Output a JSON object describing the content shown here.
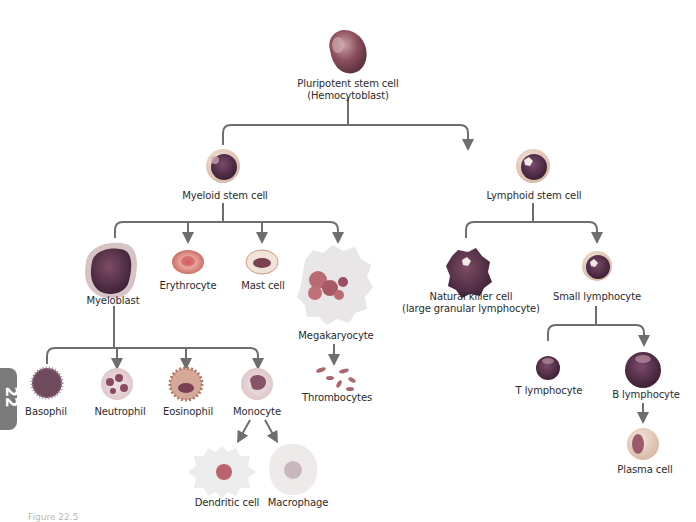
{
  "diagram": {
    "side_tab": "22",
    "caption": "Figure 22.5",
    "connector_color": "#6e6e6e",
    "nodes": {
      "hemocytoblast": {
        "line1": "Pluripotent stem cell",
        "line2": "(Hemocytoblast)"
      },
      "myeloid_stem": {
        "label": "Myeloid stem cell"
      },
      "lymphoid_stem": {
        "label": "Lymphoid stem cell"
      },
      "myeloblast": {
        "label": "Myeloblast"
      },
      "erythrocyte": {
        "label": "Erythrocyte"
      },
      "mast_cell": {
        "label": "Mast cell"
      },
      "megakaryocyte": {
        "label": "Megakaryocyte"
      },
      "thrombocytes": {
        "label": "Thrombocytes"
      },
      "basophil": {
        "label": "Basophil"
      },
      "neutrophil": {
        "label": "Neutrophil"
      },
      "eosinophil": {
        "label": "Eosinophil"
      },
      "monocyte": {
        "label": "Monocyte"
      },
      "dendritic": {
        "label": "Dendritic cell"
      },
      "macrophage": {
        "label": "Macrophage"
      },
      "nk_cell": {
        "line1": "Natural killer cell",
        "line2": "(large granular lymphocyte)"
      },
      "small_lymphocyte": {
        "label": "Small lymphocyte"
      },
      "t_lymphocyte": {
        "label": "T lymphocyte"
      },
      "b_lymphocyte": {
        "label": "B lymphocyte"
      },
      "plasma_cell": {
        "label": "Plasma cell"
      }
    },
    "edges": [
      [
        "hemocytoblast",
        "myeloid_stem"
      ],
      [
        "hemocytoblast",
        "lymphoid_stem"
      ],
      [
        "myeloid_stem",
        "myeloblast"
      ],
      [
        "myeloid_stem",
        "erythrocyte"
      ],
      [
        "myeloid_stem",
        "mast_cell"
      ],
      [
        "myeloid_stem",
        "megakaryocyte"
      ],
      [
        "megakaryocyte",
        "thrombocytes"
      ],
      [
        "myeloblast",
        "basophil"
      ],
      [
        "myeloblast",
        "neutrophil"
      ],
      [
        "myeloblast",
        "eosinophil"
      ],
      [
        "myeloblast",
        "monocyte"
      ],
      [
        "monocyte",
        "dendritic"
      ],
      [
        "monocyte",
        "macrophage"
      ],
      [
        "lymphoid_stem",
        "nk_cell"
      ],
      [
        "lymphoid_stem",
        "small_lymphocyte"
      ],
      [
        "small_lymphocyte",
        "t_lymphocyte"
      ],
      [
        "small_lymphocyte",
        "b_lymphocyte"
      ],
      [
        "b_lymphocyte",
        "plasma_cell"
      ]
    ]
  }
}
